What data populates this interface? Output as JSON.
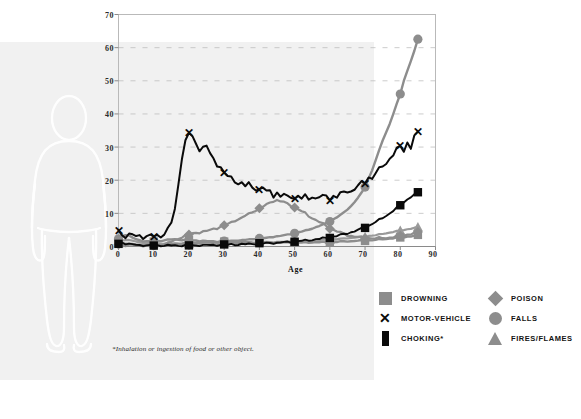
{
  "chart_data": {
    "type": "line",
    "title": "",
    "xlabel": "Age",
    "ylabel": "",
    "xlim": [
      0,
      90
    ],
    "ylim": [
      0,
      70
    ],
    "xticks": [
      0,
      10,
      20,
      30,
      40,
      50,
      60,
      70,
      80,
      90
    ],
    "yticks": [
      0,
      10,
      20,
      30,
      40,
      50,
      60,
      70
    ],
    "grid": "horizontal-dashed",
    "legend_position": "bottom-right",
    "footnote": "*Inhalation or ingestion of food or other object.",
    "x": [
      0,
      1,
      2,
      3,
      4,
      5,
      6,
      7,
      8,
      9,
      10,
      11,
      12,
      13,
      14,
      15,
      16,
      17,
      18,
      19,
      20,
      21,
      22,
      23,
      24,
      25,
      26,
      27,
      28,
      29,
      30,
      31,
      32,
      33,
      34,
      35,
      36,
      37,
      38,
      39,
      40,
      41,
      42,
      43,
      44,
      45,
      46,
      47,
      48,
      49,
      50,
      51,
      52,
      53,
      54,
      55,
      56,
      57,
      58,
      59,
      60,
      61,
      62,
      63,
      64,
      65,
      66,
      67,
      68,
      69,
      70,
      71,
      72,
      73,
      74,
      75,
      76,
      77,
      78,
      79,
      80,
      81,
      82,
      83,
      84,
      85
    ],
    "series": [
      {
        "name": "MOTOR-VEHICLE",
        "color": "#0a0a0a",
        "marker": "x",
        "values": [
          4.8,
          3.5,
          3.3,
          3.4,
          3.3,
          3.2,
          3.3,
          3.1,
          3.0,
          3.0,
          3.1,
          3.2,
          3.4,
          3.9,
          5.0,
          7.2,
          11.0,
          19.0,
          27.0,
          31.5,
          34.2,
          33.0,
          31.0,
          29.6,
          29.8,
          30.2,
          28.0,
          26.2,
          25.0,
          24.0,
          22.0,
          21.2,
          20.6,
          20.0,
          19.2,
          19.0,
          18.2,
          18.8,
          18.0,
          17.6,
          17.0,
          17.8,
          16.4,
          16.8,
          15.6,
          16.2,
          15.0,
          15.6,
          14.8,
          15.4,
          14.6,
          15.2,
          14.4,
          15.0,
          14.6,
          15.2,
          14.4,
          15.0,
          14.8,
          15.4,
          14.6,
          15.2,
          15.0,
          15.8,
          16.2,
          17.0,
          16.6,
          17.4,
          18.2,
          19.0,
          19.6,
          21.0,
          20.6,
          22.2,
          23.0,
          24.4,
          25.2,
          26.6,
          27.8,
          29.0,
          30.2,
          29.0,
          31.4,
          30.0,
          33.0,
          34.2
        ]
      },
      {
        "name": "FALLS",
        "color": "#8d8d8d",
        "marker": "circle",
        "values": [
          2.3,
          1.1,
          0.9,
          0.8,
          0.7,
          0.6,
          0.5,
          0.5,
          0.4,
          0.4,
          0.4,
          0.4,
          0.4,
          0.5,
          0.5,
          0.6,
          0.7,
          0.8,
          0.9,
          1.0,
          1.0,
          1.1,
          1.1,
          1.2,
          1.2,
          1.3,
          1.3,
          1.4,
          1.4,
          1.5,
          1.6,
          1.6,
          1.7,
          1.8,
          1.8,
          1.9,
          2.0,
          2.1,
          2.2,
          2.3,
          2.4,
          2.5,
          2.6,
          2.8,
          2.9,
          3.1,
          3.2,
          3.4,
          3.6,
          3.8,
          4.0,
          4.3,
          4.5,
          4.8,
          5.1,
          5.4,
          5.8,
          6.2,
          6.6,
          7.1,
          7.6,
          8.2,
          8.8,
          9.5,
          10.3,
          11.2,
          12.2,
          13.4,
          14.7,
          16.2,
          18.0,
          20.5,
          23.0,
          26.0,
          29.0,
          32.0,
          34.5,
          37.0,
          40.0,
          43.0,
          46.0,
          50.0,
          53.0,
          56.0,
          59.0,
          62.5
        ]
      },
      {
        "name": "POISON",
        "color": "#8d8d8d",
        "marker": "diamond",
        "values": [
          0.6,
          0.4,
          0.4,
          0.4,
          0.4,
          0.3,
          0.3,
          0.3,
          0.3,
          0.3,
          0.3,
          0.4,
          0.5,
          0.7,
          1.0,
          1.4,
          1.9,
          2.4,
          2.9,
          3.3,
          3.6,
          3.9,
          4.1,
          4.3,
          4.5,
          4.6,
          5.0,
          5.3,
          5.6,
          6.0,
          6.3,
          6.8,
          7.2,
          7.8,
          8.3,
          8.6,
          9.3,
          9.8,
          10.4,
          11.0,
          11.4,
          12.0,
          12.6,
          13.2,
          13.8,
          14.0,
          13.6,
          13.4,
          12.8,
          12.4,
          11.8,
          11.2,
          10.6,
          10.0,
          9.2,
          8.6,
          8.0,
          7.4,
          6.8,
          6.2,
          5.6,
          5.0,
          4.6,
          4.2,
          3.8,
          3.4,
          3.2,
          3.0,
          2.8,
          2.7,
          2.6,
          2.6,
          2.5,
          2.5,
          2.5,
          2.6,
          2.6,
          2.7,
          2.8,
          3.0,
          3.2,
          3.4,
          3.6,
          3.8,
          4.0,
          4.2
        ]
      },
      {
        "name": "DROWNING",
        "color": "#8d8d8d",
        "marker": "square",
        "values": [
          1.2,
          3.2,
          3.6,
          3.2,
          2.6,
          2.2,
          1.9,
          1.7,
          1.6,
          1.5,
          1.5,
          1.6,
          1.7,
          1.9,
          2.0,
          2.1,
          2.1,
          2.1,
          2.0,
          2.0,
          1.9,
          1.8,
          1.8,
          1.7,
          1.7,
          1.6,
          1.6,
          1.5,
          1.5,
          1.5,
          1.4,
          1.4,
          1.4,
          1.3,
          1.3,
          1.3,
          1.3,
          1.2,
          1.2,
          1.2,
          1.2,
          1.2,
          1.2,
          1.2,
          1.2,
          1.2,
          1.2,
          1.2,
          1.2,
          1.2,
          1.2,
          1.2,
          1.2,
          1.2,
          1.2,
          1.3,
          1.3,
          1.3,
          1.3,
          1.3,
          1.4,
          1.4,
          1.4,
          1.5,
          1.5,
          1.6,
          1.6,
          1.7,
          1.7,
          1.8,
          1.8,
          1.9,
          1.9,
          2.0,
          2.1,
          2.2,
          2.3,
          2.4,
          2.5,
          2.6,
          2.7,
          2.8,
          3.0,
          3.1,
          3.2,
          3.4
        ]
      },
      {
        "name": "FIRES/FLAMES",
        "color": "#9a9a9a",
        "marker": "triangle",
        "values": [
          1.0,
          1.8,
          2.0,
          1.9,
          1.7,
          1.5,
          1.3,
          1.2,
          1.1,
          1.0,
          1.0,
          0.9,
          0.9,
          0.9,
          0.9,
          0.9,
          0.9,
          0.9,
          0.9,
          0.9,
          0.9,
          0.9,
          0.9,
          0.9,
          0.9,
          0.9,
          0.9,
          0.9,
          1.0,
          1.0,
          1.0,
          1.0,
          1.0,
          1.1,
          1.1,
          1.1,
          1.1,
          1.2,
          1.2,
          1.2,
          1.2,
          1.3,
          1.3,
          1.3,
          1.3,
          1.4,
          1.4,
          1.4,
          1.5,
          1.5,
          1.5,
          1.6,
          1.6,
          1.7,
          1.7,
          1.8,
          1.8,
          1.9,
          2.0,
          2.0,
          2.1,
          2.2,
          2.2,
          2.3,
          2.4,
          2.5,
          2.6,
          2.7,
          2.8,
          2.9,
          3.0,
          3.2,
          3.3,
          3.4,
          3.6,
          3.8,
          4.0,
          4.2,
          4.4,
          4.6,
          4.8,
          5.0,
          5.2,
          5.4,
          5.6,
          5.8
        ]
      },
      {
        "name": "CHOKING",
        "color": "#0a0a0a",
        "marker": "square",
        "values": [
          0.8,
          1.2,
          0.9,
          0.7,
          0.6,
          0.5,
          0.4,
          0.4,
          0.3,
          0.3,
          0.3,
          0.3,
          0.3,
          0.3,
          0.3,
          0.3,
          0.3,
          0.3,
          0.3,
          0.3,
          0.3,
          0.3,
          0.3,
          0.4,
          0.4,
          0.4,
          0.4,
          0.4,
          0.5,
          0.5,
          0.5,
          0.5,
          0.6,
          0.6,
          0.6,
          0.7,
          0.7,
          0.7,
          0.8,
          0.8,
          0.9,
          0.9,
          1.0,
          1.0,
          1.1,
          1.1,
          1.2,
          1.3,
          1.3,
          1.4,
          1.5,
          1.6,
          1.7,
          1.8,
          1.9,
          2.0,
          2.2,
          2.3,
          2.5,
          2.6,
          2.8,
          3.0,
          3.2,
          3.5,
          3.7,
          4.0,
          4.3,
          4.6,
          5.0,
          5.4,
          5.8,
          6.3,
          6.8,
          7.4,
          8.0,
          8.6,
          9.3,
          10.0,
          10.8,
          11.6,
          12.4,
          13.4,
          14.2,
          15.0,
          15.6,
          16.2
        ]
      }
    ]
  },
  "axis": {
    "y_ticks": [
      "0",
      "10",
      "20",
      "30",
      "40",
      "50",
      "60",
      "70"
    ],
    "x_ticks": [
      "0",
      "10",
      "20",
      "30",
      "40",
      "50",
      "60",
      "70",
      "80",
      "90"
    ],
    "x_title": "Age"
  },
  "legend": {
    "column1": [
      {
        "label": "DROWNING",
        "marker": "square",
        "color": "#8d8d8d"
      },
      {
        "label": "MOTOR-VEHICLE",
        "marker": "x",
        "color": "#0a0a0a"
      },
      {
        "label": "CHOKING*",
        "marker": "rect",
        "color": "#0a0a0a"
      }
    ],
    "column2": [
      {
        "label": "POISON",
        "marker": "diamond",
        "color": "#8d8d8d"
      },
      {
        "label": "FALLS",
        "marker": "circle",
        "color": "#8d8d8d"
      },
      {
        "label": "FIRES/FLAMES",
        "marker": "triangle",
        "color": "#8d8d8d"
      }
    ]
  },
  "footnote": {
    "text": "*Inhalation or ingestion of food or other object."
  },
  "colors": {
    "panel": "#f1f1f1",
    "gray_series": "#8d8d8d",
    "black_series": "#0a0a0a",
    "grid": "#bdbdbd",
    "frame": "#b9b9b9",
    "background": "#ffffff"
  }
}
